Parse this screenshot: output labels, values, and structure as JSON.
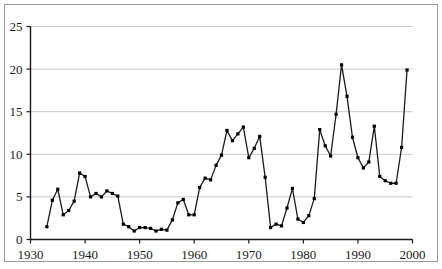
{
  "chart_data": {
    "type": "line",
    "title": "",
    "subtitle": "",
    "xlabel": "",
    "ylabel": "",
    "xlim": [
      1930,
      2000
    ],
    "ylim": [
      0,
      25
    ],
    "grid": true,
    "grid_axis": "y",
    "legend": false,
    "legend_position": "none",
    "markers": "square",
    "marker_color": "#000000",
    "line_color": "#1a1a1a",
    "x_ticks": [
      1930,
      1940,
      1950,
      1960,
      1970,
      1980,
      1990,
      2000
    ],
    "x_tick_labels": [
      "1930",
      "1940",
      "1950",
      "1960",
      "1970",
      "1980",
      "1990",
      "2000"
    ],
    "y_ticks": [
      0,
      5,
      10,
      15,
      20,
      25
    ],
    "y_tick_labels": [
      "0",
      "5",
      "10",
      "15",
      "20",
      "25"
    ],
    "x": [
      1933,
      1934,
      1935,
      1936,
      1937,
      1938,
      1939,
      1940,
      1941,
      1942,
      1943,
      1944,
      1945,
      1946,
      1947,
      1948,
      1949,
      1950,
      1951,
      1952,
      1953,
      1954,
      1955,
      1956,
      1957,
      1958,
      1959,
      1960,
      1961,
      1962,
      1963,
      1964,
      1965,
      1966,
      1967,
      1968,
      1969,
      1970,
      1971,
      1972,
      1973,
      1974,
      1975,
      1976,
      1977,
      1978,
      1979,
      1980,
      1981,
      1982,
      1983,
      1984,
      1985,
      1986,
      1987,
      1988,
      1989,
      1990,
      1991,
      1992,
      1993,
      1994,
      1995,
      1996,
      1997,
      1998,
      1999
    ],
    "values": [
      1.5,
      4.6,
      5.9,
      2.9,
      3.4,
      4.5,
      7.8,
      7.4,
      5.0,
      5.4,
      5.0,
      5.7,
      5.4,
      5.1,
      1.8,
      1.5,
      1.0,
      1.4,
      1.4,
      1.3,
      1.0,
      1.2,
      1.1,
      2.3,
      4.3,
      4.7,
      2.9,
      2.9,
      6.1,
      7.2,
      7.0,
      8.7,
      9.9,
      12.8,
      11.6,
      12.4,
      13.2,
      9.6,
      10.7,
      12.1,
      7.3,
      1.4,
      1.8,
      1.6,
      3.7,
      6.0,
      2.4,
      2.0,
      2.8,
      4.8,
      12.9,
      11.0,
      9.8,
      14.7,
      20.5,
      16.8,
      12.0,
      9.6,
      8.4,
      9.1,
      13.3,
      7.4,
      6.9,
      6.6,
      6.6,
      10.8,
      19.9
    ]
  },
  "figure": {
    "frame_color": "#9b9b9b",
    "gridline_color": "#c8c8c8",
    "axis_color": "#1a1a1a",
    "background": "#ffffff"
  }
}
